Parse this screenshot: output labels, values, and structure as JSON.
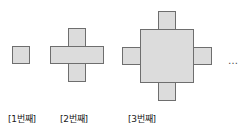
{
  "figure": {
    "background_color": "#ffffff",
    "cell_fill_color": "#dcdcdc",
    "cell_stroke_color": "#6e6e6e",
    "cell_size_px": 18,
    "continuation_mark": "…"
  },
  "items": [
    {
      "index": 1,
      "caption": "[1번째]",
      "cell_count": 1,
      "row_widths": [
        1
      ],
      "caption_x": 8,
      "caption_y": 112,
      "origin_x": 12,
      "origin_y": 46,
      "bars": [
        {
          "x": 0,
          "y": 0,
          "w": 1,
          "h": 1
        }
      ]
    },
    {
      "index": 2,
      "caption": "[2번째]",
      "cell_count": 5,
      "row_widths": [
        1,
        3,
        1
      ],
      "caption_x": 60,
      "caption_y": 112,
      "origin_x": 50,
      "origin_y": 28,
      "bars": [
        {
          "x": 1,
          "y": 0,
          "w": 1,
          "h": 3
        },
        {
          "x": 0,
          "y": 1,
          "w": 3,
          "h": 1
        }
      ]
    },
    {
      "index": 3,
      "caption": "[3번째]",
      "cell_count": 13,
      "row_widths": [
        1,
        3,
        5,
        3,
        1
      ],
      "caption_x": 128,
      "caption_y": 112,
      "origin_x": 122,
      "origin_y": 11,
      "bars": [
        {
          "x": 2,
          "y": 0,
          "w": 1,
          "h": 5
        },
        {
          "x": 0,
          "y": 2,
          "w": 5,
          "h": 1
        },
        {
          "x": 1,
          "y": 1,
          "w": 3,
          "h": 3
        }
      ]
    }
  ],
  "continuation": {
    "label": "…",
    "x": 228,
    "y": 55
  }
}
